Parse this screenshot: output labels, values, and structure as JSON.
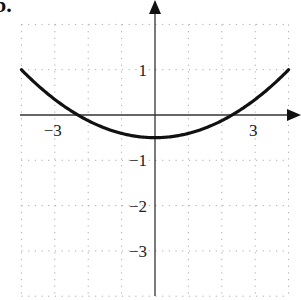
{
  "figure_label": "b.",
  "chart_data": {
    "type": "line",
    "title": "",
    "xlabel": "",
    "ylabel": "",
    "xlim": [
      -4,
      4
    ],
    "ylim": [
      -4,
      2
    ],
    "grid": true,
    "grid_style": "dotted",
    "x_tick_labels": [
      {
        "value": -3,
        "label": "−3"
      },
      {
        "value": 3,
        "label": "3"
      }
    ],
    "y_tick_labels": [
      {
        "value": 1,
        "label": "1"
      },
      {
        "value": -1,
        "label": "−1"
      },
      {
        "value": -2,
        "label": "−2"
      },
      {
        "value": -3,
        "label": "−3"
      }
    ],
    "series": [
      {
        "name": "curve",
        "description": "upward-opening parabola, vertex (0, -0.5), x-intercepts about ±2.3",
        "x": [
          -4,
          -3.5,
          -3,
          -2.5,
          -2,
          -1.5,
          -1,
          -0.5,
          0,
          0.5,
          1,
          1.5,
          2,
          2.5,
          3,
          3.5,
          4
        ],
        "y": [
          1.0,
          0.65,
          0.34,
          0.09,
          -0.12,
          -0.29,
          -0.41,
          -0.48,
          -0.5,
          -0.48,
          -0.41,
          -0.29,
          -0.12,
          0.09,
          0.34,
          0.65,
          1.0
        ]
      }
    ]
  }
}
